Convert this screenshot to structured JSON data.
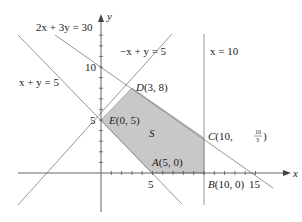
{
  "diagram": {
    "type": "linear-programming-feasible-region",
    "axes": {
      "x_label": "x",
      "y_label": "y",
      "x_ticks": [
        "5",
        "15"
      ],
      "y_ticks": [
        "5",
        "10"
      ]
    },
    "lines": [
      {
        "id": "l1",
        "label": "2x + 3y = 30"
      },
      {
        "id": "l2",
        "label": "−x + y = 5"
      },
      {
        "id": "l3",
        "label": "x = 10"
      },
      {
        "id": "l4",
        "label": "x + y = 5"
      }
    ],
    "region": {
      "label": "S",
      "fill": "#c8c8c8"
    },
    "vertices": {
      "A": {
        "name": "A",
        "coords": "(5, 0)"
      },
      "B": {
        "name": "B",
        "coords": "(10, 0)"
      },
      "C": {
        "name": "C",
        "coords_prefix": "(10,",
        "frac_num": "10",
        "frac_den": "3",
        "coords_suffix": ")"
      },
      "D": {
        "name": "D",
        "coords": "(3, 8)"
      },
      "E": {
        "name": "E",
        "coords": "(0, 5)"
      }
    },
    "colors": {
      "lines": "#8a8a8a",
      "axes": "#555555",
      "region": "#c8c8c8"
    }
  }
}
